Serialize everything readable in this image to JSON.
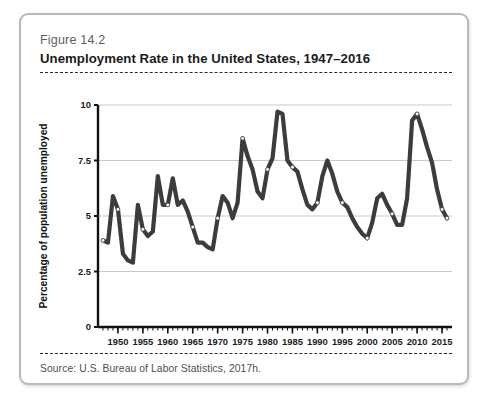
{
  "figure": {
    "number": "Figure 14.2",
    "title": "Unemployment Rate in the United States, 1947–2016",
    "source": "Source: U.S. Bureau of Labor Statistics, 2017h."
  },
  "colors": {
    "line": "#3c3c3c",
    "marker_fill": "#ffffff",
    "gridline": "#c9c9c9",
    "axis": "#111111",
    "card_border": "#b9b9b9",
    "dashed_rule": "#2b2b2b"
  },
  "chart_data": {
    "type": "line",
    "title": "Unemployment Rate in the United States, 1947–2016",
    "xlabel": "",
    "ylabel": "Percentage of population unemployed",
    "xlim": [
      1946,
      2017
    ],
    "ylim": [
      0,
      10
    ],
    "ytick_labels": [
      "0",
      "2.5",
      "5",
      "7.5",
      "10"
    ],
    "ytick_values": [
      0,
      2.5,
      5,
      7.5,
      10
    ],
    "xtick_labels": [
      "1950",
      "1955",
      "1960",
      "1965",
      "1970",
      "1975",
      "1980",
      "1985",
      "1990",
      "1995",
      "2000",
      "2005",
      "2010",
      "2015"
    ],
    "xtick_values": [
      1950,
      1955,
      1960,
      1965,
      1970,
      1975,
      1980,
      1985,
      1990,
      1995,
      2000,
      2005,
      2010,
      2015
    ],
    "minor_tick_interval": 1,
    "grid": "horizontal",
    "legend": "none",
    "markers": "small white circles at five-year intervals",
    "x": [
      1947,
      1948,
      1949,
      1950,
      1951,
      1952,
      1953,
      1954,
      1955,
      1956,
      1957,
      1958,
      1959,
      1960,
      1961,
      1962,
      1963,
      1964,
      1965,
      1966,
      1967,
      1968,
      1969,
      1970,
      1971,
      1972,
      1973,
      1974,
      1975,
      1976,
      1977,
      1978,
      1979,
      1980,
      1981,
      1982,
      1983,
      1984,
      1985,
      1986,
      1987,
      1988,
      1989,
      1990,
      1991,
      1992,
      1993,
      1994,
      1995,
      1996,
      1997,
      1998,
      1999,
      2000,
      2001,
      2002,
      2003,
      2004,
      2005,
      2006,
      2007,
      2008,
      2009,
      2010,
      2011,
      2012,
      2013,
      2014,
      2015,
      2016
    ],
    "values": [
      3.9,
      3.8,
      5.9,
      5.3,
      3.3,
      3.0,
      2.9,
      5.5,
      4.4,
      4.1,
      4.3,
      6.8,
      5.5,
      5.5,
      6.7,
      5.5,
      5.7,
      5.2,
      4.5,
      3.8,
      3.8,
      3.6,
      3.5,
      4.9,
      5.9,
      5.6,
      4.9,
      5.6,
      8.5,
      7.7,
      7.1,
      6.1,
      5.8,
      7.1,
      7.6,
      9.7,
      9.6,
      7.5,
      7.2,
      7.0,
      6.2,
      5.5,
      5.3,
      5.6,
      6.8,
      7.5,
      6.9,
      6.1,
      5.6,
      5.4,
      4.9,
      4.5,
      4.2,
      4.0,
      4.7,
      5.8,
      6.0,
      5.5,
      5.1,
      4.6,
      4.6,
      5.8,
      9.3,
      9.6,
      8.9,
      8.1,
      7.4,
      6.2,
      5.3,
      4.9
    ],
    "marker_years": [
      1947,
      1950,
      1955,
      1960,
      1965,
      1970,
      1975,
      1980,
      1985,
      1990,
      1995,
      2000,
      2005,
      2010,
      2015,
      2016
    ]
  }
}
